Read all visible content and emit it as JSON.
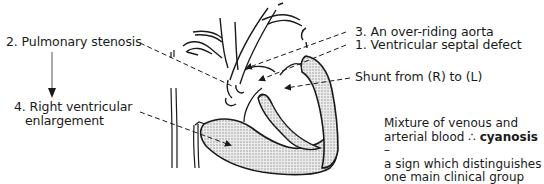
{
  "labels": {
    "pulmonary_stenosis": "2. Pulmonary stenosis",
    "right_ventricular_1": "4. Right ventricular",
    "right_ventricular_2": "enlargement",
    "overriding_aorta": "3. An over-riding aorta",
    "vsd": "1. Ventricular septal defect",
    "shunt": "Shunt from (R) to (L)"
  },
  "note": {
    "line1": "Mixture of venous and",
    "line2_pre": "arterial blood ∴ ",
    "line2_bold": "cyanosis",
    "line2_post": " –",
    "line3": "a sign which distinguishes",
    "line4": "one main clinical group"
  },
  "colors": {
    "ink": "#1a1a1a",
    "shading": "#d9d9d9"
  }
}
